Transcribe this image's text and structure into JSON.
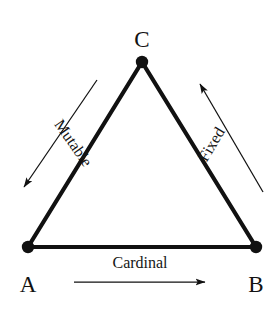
{
  "diagram": {
    "type": "triangle-relationship-diagram",
    "background_color": "#ffffff",
    "stroke_color": "#111111",
    "vertices": [
      {
        "id": "A",
        "label": "A",
        "x": 28,
        "y": 247,
        "label_x": 28,
        "label_y": 292
      },
      {
        "id": "B",
        "label": "B",
        "x": 256,
        "y": 247,
        "label_x": 256,
        "label_y": 292
      },
      {
        "id": "C",
        "label": "C",
        "x": 142,
        "y": 62,
        "label_x": 142,
        "label_y": 47
      }
    ],
    "edges": [
      {
        "id": "edge-ab",
        "from": "A",
        "to": "B",
        "thickness": 4.2
      },
      {
        "id": "edge-ac",
        "from": "A",
        "to": "C",
        "thickness": 4.2
      },
      {
        "id": "edge-bc",
        "from": "B",
        "to": "C",
        "thickness": 4.2
      }
    ],
    "annotations": [
      {
        "id": "mutable",
        "label": "Mutable",
        "direction": "down-left",
        "from_x": 97,
        "from_y": 80,
        "to_x": 21,
        "to_y": 191,
        "text_x": 69,
        "text_y": 146,
        "rotation": 55
      },
      {
        "id": "fixed",
        "label": "Fixed",
        "direction": "up-right",
        "from_x": 263,
        "from_y": 192,
        "to_x": 197,
        "to_y": 80,
        "text_x": 215,
        "text_y": 146,
        "rotation": -59
      },
      {
        "id": "cardinal",
        "label": "Cardinal",
        "direction": "right",
        "from_x": 74,
        "from_y": 282,
        "to_x": 209,
        "to_y": 282,
        "text_x": 140,
        "text_y": 268,
        "rotation": 0
      }
    ]
  }
}
